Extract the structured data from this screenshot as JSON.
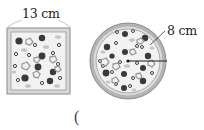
{
  "figure": {
    "square_pizza": {
      "label": "13 cm",
      "side_cm": 13
    },
    "round_pizza": {
      "label": "8 cm",
      "radius_cm": 8
    },
    "answer_blank": "("
  },
  "colors": {
    "crust": "#a8a8a8",
    "crust_inner": "#d4d4d4",
    "topping_dark": "#3a3a3a",
    "topping_light": "#bdbdbd",
    "outline": "#777777"
  }
}
